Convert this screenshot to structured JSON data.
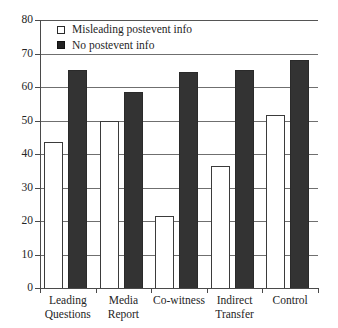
{
  "chart_data": {
    "type": "bar",
    "title": "",
    "xlabel": "",
    "ylabel": "",
    "ylim": [
      0,
      80
    ],
    "yticks": [
      0,
      10,
      20,
      30,
      40,
      50,
      60,
      70,
      80
    ],
    "ytick_labels": [
      "0",
      "10",
      "20",
      "30",
      "40",
      "50",
      "60",
      "70",
      "80"
    ],
    "grid": true,
    "legend_position": "upper left",
    "categories": [
      "Leading Questions",
      "Media Report",
      "Co-witness",
      "Indirect Transfer",
      "Control"
    ],
    "category_lines": [
      [
        "Leading",
        "Questions"
      ],
      [
        "Media",
        "Report"
      ],
      [
        "Co-witness",
        ""
      ],
      [
        "Indirect",
        "Transfer"
      ],
      [
        "Control",
        ""
      ]
    ],
    "series": [
      {
        "name": "Misleading postevent info",
        "style": "open",
        "color": "#ffffff",
        "edge_color": "#3b3b3b",
        "values": [
          43.5,
          50,
          21.5,
          36.5,
          51.5
        ]
      },
      {
        "name": "No postevent info",
        "style": "filled",
        "color": "#333333",
        "edge_color": "#2a2a2a",
        "values": [
          65,
          58.5,
          64.5,
          65,
          68
        ]
      }
    ]
  },
  "legend": {
    "items": [
      {
        "label": "Misleading postevent info",
        "style": "open"
      },
      {
        "label": "No postevent info",
        "style": "filled"
      }
    ]
  }
}
